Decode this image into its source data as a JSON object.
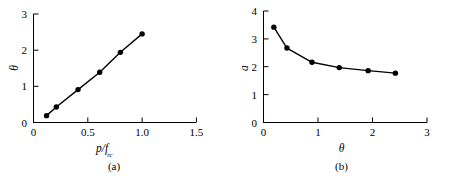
{
  "figure": {
    "background_color": "#ffffff",
    "line_color": "#000000",
    "marker_color": "#000000"
  },
  "panel_a": {
    "caption": "(a)",
    "xlabel_main": "p/f",
    "xlabel_sub": "rc",
    "ylabel": "θ",
    "xticks": [
      "0",
      "0.5",
      "1.0",
      "1.5"
    ],
    "yticks": [
      "0",
      "1",
      "2",
      "3"
    ]
  },
  "panel_b": {
    "caption": "(b)",
    "xlabel": "θ",
    "ylabel": "a",
    "xticks": [
      "0",
      "1",
      "2",
      "3"
    ],
    "yticks": [
      "0",
      "1",
      "2",
      "3",
      "4"
    ]
  },
  "chart_data": [
    {
      "type": "line",
      "title": "(a)",
      "xlabel": "p/f_rc",
      "ylabel": "θ",
      "xlim": [
        0,
        1.5
      ],
      "ylim": [
        0,
        3
      ],
      "xticks": [
        0,
        0.5,
        1.0,
        1.5
      ],
      "yticks": [
        0,
        1,
        2,
        3
      ],
      "grid": false,
      "legend": "none",
      "markers": "filled-circle",
      "x": [
        0.12,
        0.21,
        0.41,
        0.61,
        0.8,
        1.0
      ],
      "y": [
        0.19,
        0.43,
        0.91,
        1.39,
        1.94,
        2.45
      ]
    },
    {
      "type": "line",
      "title": "(b)",
      "xlabel": "θ",
      "ylabel": "a",
      "xlim": [
        0,
        3
      ],
      "ylim": [
        0,
        4
      ],
      "xticks": [
        0,
        1,
        2,
        3
      ],
      "yticks": [
        0,
        1,
        2,
        3,
        4
      ],
      "grid": false,
      "legend": "none",
      "markers": "filled-circle",
      "x": [
        0.19,
        0.43,
        0.89,
        1.39,
        1.92,
        2.42
      ],
      "y": [
        3.42,
        2.67,
        2.16,
        1.97,
        1.86,
        1.77
      ]
    }
  ]
}
